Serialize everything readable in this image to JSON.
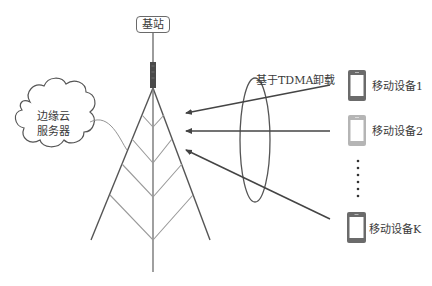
{
  "diagram": {
    "base_station": {
      "label": "基站"
    },
    "edge_cloud": {
      "line1": "边缘云",
      "line2": "服务器"
    },
    "offload_label": "基于TDMA卸载",
    "devices": [
      {
        "label": "移动设备1",
        "color": "#6b6b6b"
      },
      {
        "label": "移动设备2",
        "color": "#b5b5b5"
      },
      {
        "label": "移动设备K",
        "color": "#6b6b6b"
      }
    ],
    "ellipsis": "⋮",
    "colors": {
      "line": "#555555",
      "tower_light": "#9a9a9a",
      "antenna": "#4a4a4a"
    }
  }
}
